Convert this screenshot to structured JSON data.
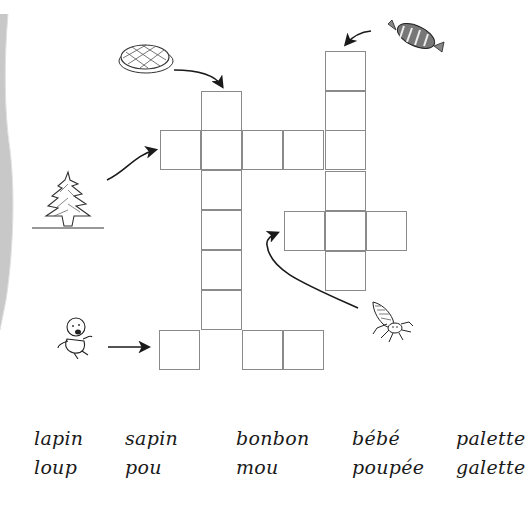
{
  "worksheet": {
    "type": "crossword",
    "language": "fr",
    "clues": [
      {
        "id": "galette",
        "picture": "galette-cake",
        "direction": "down",
        "length": 6
      },
      {
        "id": "bonbon",
        "picture": "wrapped-candy",
        "direction": "down",
        "length": 6
      },
      {
        "id": "sapin",
        "picture": "fir-tree",
        "direction": "across",
        "length": 5
      },
      {
        "id": "pou",
        "picture": "louse",
        "direction": "across",
        "length": 3
      },
      {
        "id": "bebe",
        "picture": "baby",
        "direction": "across",
        "length": 4
      }
    ]
  },
  "word_bank": {
    "row1": [
      "lapin",
      "sapin",
      "bonbon",
      "bébé",
      "palette"
    ],
    "row2": [
      "loup",
      "pou",
      "mou",
      "poupée",
      "galette"
    ]
  },
  "colors": {
    "grid_line": "#8a8a8a",
    "ink": "#1a1a1a",
    "page_shadow": "#c8c8c8"
  }
}
